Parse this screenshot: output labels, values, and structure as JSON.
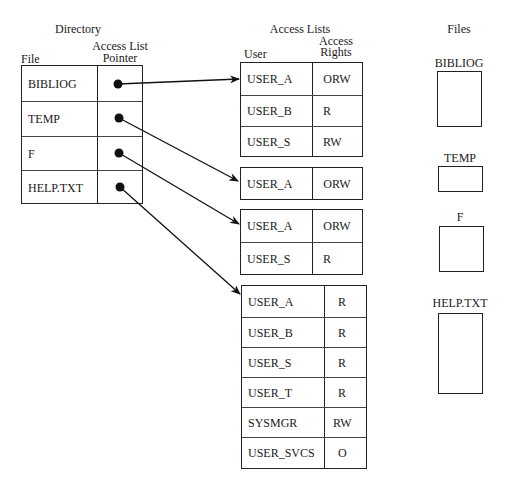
{
  "directory": {
    "title": "Directory",
    "col_file": "File",
    "col_pointer_line1": "Access List",
    "col_pointer_line2": "Pointer",
    "rows": [
      {
        "file": "BIBLIOG"
      },
      {
        "file": "TEMP"
      },
      {
        "file": "F"
      },
      {
        "file": "HELP.TXT"
      }
    ]
  },
  "access_lists": {
    "title": "Access Lists",
    "col_user": "User",
    "col_rights_line1": "Access",
    "col_rights_line2": "Rights",
    "lists": [
      {
        "for_file": "BIBLIOG",
        "entries": [
          {
            "user": "USER_A",
            "rights": "ORW"
          },
          {
            "user": "USER_B",
            "rights": "R"
          },
          {
            "user": "USER_S",
            "rights": "RW"
          }
        ]
      },
      {
        "for_file": "TEMP",
        "entries": [
          {
            "user": "USER_A",
            "rights": "ORW"
          }
        ]
      },
      {
        "for_file": "F",
        "entries": [
          {
            "user": "USER_A",
            "rights": "ORW"
          },
          {
            "user": "USER_S",
            "rights": "R"
          }
        ]
      },
      {
        "for_file": "HELP.TXT",
        "entries": [
          {
            "user": "USER_A",
            "rights": "R"
          },
          {
            "user": "USER_B",
            "rights": "R"
          },
          {
            "user": "USER_S",
            "rights": "R"
          },
          {
            "user": "USER_T",
            "rights": "R"
          },
          {
            "user": "SYSMGR",
            "rights": "RW"
          },
          {
            "user": "USER_SVCS",
            "rights": "O"
          }
        ]
      }
    ]
  },
  "files": {
    "title": "Files",
    "items": [
      {
        "name": "BIBLIOG"
      },
      {
        "name": "TEMP"
      },
      {
        "name": "F"
      },
      {
        "name": "HELP.TXT"
      }
    ]
  },
  "colors": {
    "line": "#222222",
    "background": "#ffffff"
  }
}
